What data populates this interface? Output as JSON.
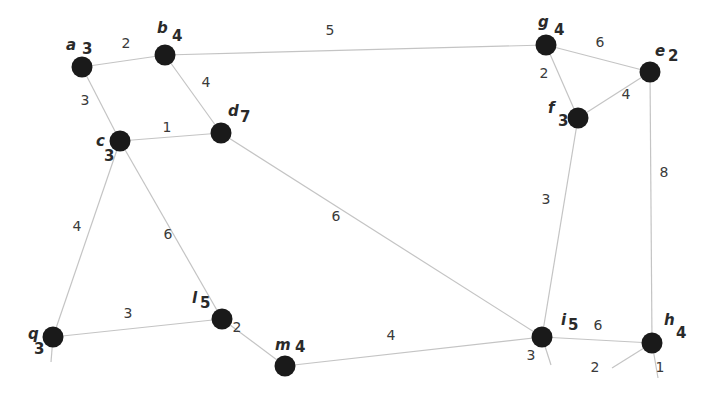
{
  "diagram": {
    "type": "weighted-undirected-graph",
    "nodes": [
      {
        "id": "a",
        "label": "a",
        "degree": "3",
        "x": 82,
        "y": 67,
        "lx": 66,
        "ly": 50,
        "dx": 82,
        "dy": 54
      },
      {
        "id": "b",
        "label": "b",
        "degree": "4",
        "x": 165,
        "y": 55,
        "lx": 157,
        "ly": 33,
        "dx": 172,
        "dy": 41
      },
      {
        "id": "c",
        "label": "c",
        "degree": "3",
        "x": 120,
        "y": 141,
        "lx": 96,
        "ly": 146,
        "dx": 104,
        "dy": 161
      },
      {
        "id": "d",
        "label": "d",
        "degree": "7",
        "x": 221,
        "y": 133,
        "lx": 228,
        "ly": 116,
        "dx": 240,
        "dy": 122
      },
      {
        "id": "g",
        "label": "g",
        "degree": "4",
        "x": 546,
        "y": 45,
        "lx": 538,
        "ly": 27,
        "dx": 554,
        "dy": 35
      },
      {
        "id": "e",
        "label": "e",
        "degree": "2",
        "x": 650,
        "y": 72,
        "lx": 655,
        "ly": 56,
        "dx": 668,
        "dy": 61
      },
      {
        "id": "f",
        "label": "f",
        "degree": "3",
        "x": 578,
        "y": 118,
        "lx": 548,
        "ly": 113,
        "dx": 558,
        "dy": 126
      },
      {
        "id": "q",
        "label": "q",
        "degree": "3",
        "x": 53,
        "y": 337,
        "lx": 28,
        "ly": 339,
        "dx": 34,
        "dy": 354
      },
      {
        "id": "l",
        "label": "l",
        "degree": "5",
        "x": 222,
        "y": 319,
        "lx": 192,
        "ly": 303,
        "dx": 200,
        "dy": 308
      },
      {
        "id": "m",
        "label": "m",
        "degree": "4",
        "x": 285,
        "y": 366,
        "lx": 275,
        "ly": 350,
        "dx": 295,
        "dy": 352
      },
      {
        "id": "i",
        "label": "i",
        "degree": "5",
        "x": 542,
        "y": 337,
        "lx": 561,
        "ly": 325,
        "dx": 568,
        "dy": 330
      },
      {
        "id": "h",
        "label": "h",
        "degree": "4",
        "x": 652,
        "y": 343,
        "lx": 664,
        "ly": 325,
        "dx": 676,
        "dy": 338
      }
    ],
    "edges": [
      {
        "from": "a",
        "to": "b",
        "weight": "2",
        "wx": 126,
        "wy": 48
      },
      {
        "from": "a",
        "to": "c",
        "weight": "3",
        "wx": 85,
        "wy": 105
      },
      {
        "from": "b",
        "to": "d",
        "weight": "4",
        "wx": 206,
        "wy": 87
      },
      {
        "from": "b",
        "to": "g",
        "weight": "5",
        "wx": 330,
        "wy": 35
      },
      {
        "from": "c",
        "to": "d",
        "weight": "1",
        "wx": 167,
        "wy": 132
      },
      {
        "from": "c",
        "to": "q",
        "weight": "4",
        "wx": 77,
        "wy": 231
      },
      {
        "from": "c",
        "to": "l",
        "weight": "6",
        "wx": 168,
        "wy": 239
      },
      {
        "from": "d",
        "to": "i",
        "weight": "6",
        "wx": 336,
        "wy": 221
      },
      {
        "from": "g",
        "to": "e",
        "weight": "6",
        "wx": 600,
        "wy": 47
      },
      {
        "from": "g",
        "to": "f",
        "weight": "2",
        "wx": 544,
        "wy": 78
      },
      {
        "from": "f",
        "to": "e",
        "weight": "4",
        "wx": 626,
        "wy": 99
      },
      {
        "from": "f",
        "to": "i",
        "weight": "3",
        "wx": 546,
        "wy": 204
      },
      {
        "from": "e",
        "to": "h",
        "weight": "8",
        "wx": 664,
        "wy": 177
      },
      {
        "from": "q",
        "to": "l",
        "weight": "3",
        "wx": 128,
        "wy": 318
      },
      {
        "from": "l",
        "to": "m",
        "weight": "2",
        "wx": 237,
        "wy": 332
      },
      {
        "from": "m",
        "to": "i",
        "weight": "4",
        "wx": 391,
        "wy": 340
      },
      {
        "from": "i",
        "to": "h",
        "weight": "6",
        "wx": 598,
        "wy": 330
      }
    ],
    "stubs": [
      {
        "at": "q",
        "x2": 51,
        "y2": 362,
        "label": ""
      },
      {
        "at": "i",
        "x2": 551,
        "y2": 365,
        "label": "3",
        "wx": 531,
        "wy": 360
      },
      {
        "at": "h",
        "x2": 612,
        "y2": 368,
        "label": "2",
        "wx": 595,
        "wy": 372
      },
      {
        "at": "h",
        "x2": 658,
        "y2": 378,
        "label": "1",
        "wx": 660,
        "wy": 372
      }
    ]
  }
}
